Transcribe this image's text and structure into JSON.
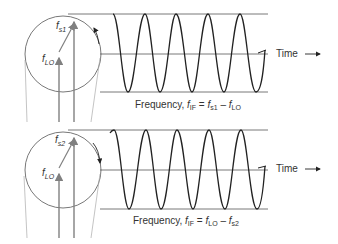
{
  "panels": [
    {
      "id": "top",
      "signal_label": "f",
      "signal_sub": "s1",
      "lo_label": "f",
      "lo_sub": "LO",
      "rotation": "counter-clockwise",
      "time_label": "Time",
      "eq_prefix": "Frequency, ",
      "eq_lhs": "f",
      "eq_lhs_sub": "IF",
      "eq_a": "f",
      "eq_a_sub": "s1",
      "eq_b": "f",
      "eq_b_sub": "LO",
      "equals": " = ",
      "minus": " – "
    },
    {
      "id": "bottom",
      "signal_label": "f",
      "signal_sub": "s2",
      "lo_label": "f",
      "lo_sub": "LO",
      "rotation": "clockwise",
      "time_label": "Time",
      "eq_prefix": "Frequency, ",
      "eq_lhs": "f",
      "eq_lhs_sub": "IF",
      "eq_a": "f",
      "eq_a_sub": "LO",
      "eq_b": "f",
      "eq_b_sub": "s2",
      "equals": " = ",
      "minus": " – "
    }
  ],
  "colors": {
    "line": "#222222",
    "phasor": "#808080",
    "guide": "#999999"
  }
}
